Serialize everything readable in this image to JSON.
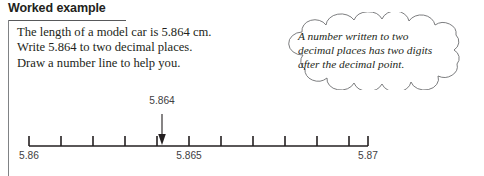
{
  "heading": {
    "title": "Worked example"
  },
  "body": {
    "lines": [
      "The length of a model car is 5.864 cm.",
      "Write 5.864 to two decimal places.",
      "Draw a number line to help you."
    ]
  },
  "callout": {
    "lines": [
      "A number written to two",
      "decimal places has two digits",
      "after the decimal point."
    ]
  },
  "number_line": {
    "callout_value": "5.864",
    "labels": [
      {
        "text": "5.86",
        "x": 29
      },
      {
        "text": "5.865",
        "x": 189
      },
      {
        "text": "5.87",
        "x": 368
      }
    ],
    "ticks": [
      {
        "x": 29
      },
      {
        "x": 61
      },
      {
        "x": 93
      },
      {
        "x": 125
      },
      {
        "x": 157
      },
      {
        "x": 189
      },
      {
        "x": 221
      },
      {
        "x": 253
      },
      {
        "x": 285
      },
      {
        "x": 317
      },
      {
        "x": 349
      },
      {
        "x": 368
      }
    ],
    "arrow": {
      "x": 162
    }
  },
  "colors": {
    "ink": "#231f20",
    "rule": "#58595b",
    "border": "#808285",
    "label": "#414042",
    "background": "#ffffff"
  }
}
